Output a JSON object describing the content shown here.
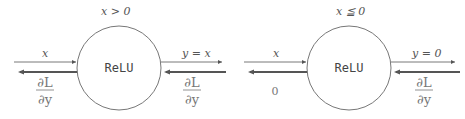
{
  "diagram": {
    "type": "computational-graph",
    "panels": [
      {
        "condition": "x > 0",
        "node_label": "ReLU",
        "forward_input": "x",
        "forward_output": "y = x",
        "backward_input": {
          "numerator": "∂L",
          "denominator": "∂y"
        },
        "backward_output": {
          "numerator": "∂L",
          "denominator": "∂y"
        }
      },
      {
        "condition": "x ≦ 0",
        "node_label": "ReLU",
        "forward_input": "x",
        "forward_output": "y = 0",
        "backward_input": {
          "numerator": "∂L",
          "denominator": "∂y"
        },
        "backward_output_value": "0"
      }
    ],
    "colors": {
      "forward_arrow": "#555555",
      "backward_arrow": "#555555",
      "circle_stroke": "#777777"
    }
  }
}
